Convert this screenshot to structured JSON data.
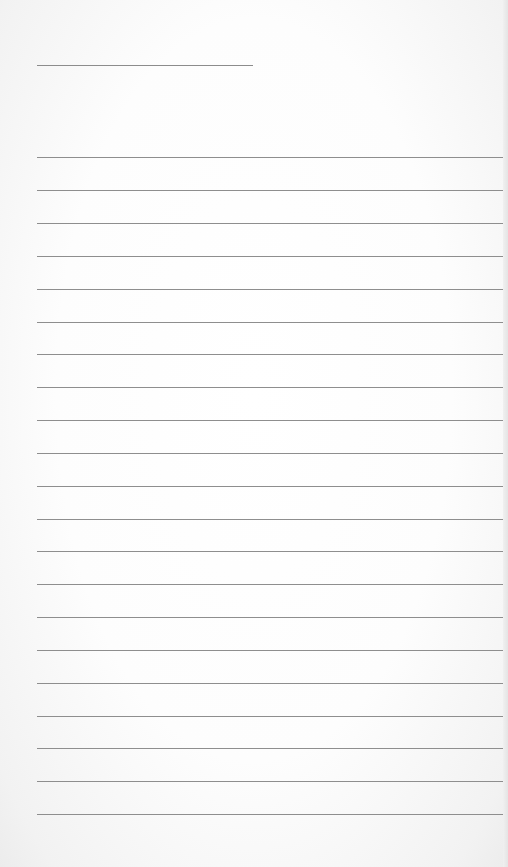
{
  "page": {
    "type": "lined notepad sheet",
    "background_color": "#fdfdfd",
    "line_color": "#8e8e8e"
  },
  "header_line": {
    "x": 37,
    "y": 65,
    "width": 216
  },
  "rules": {
    "count": 21,
    "x": 37,
    "width": 467,
    "y_positions": [
      157,
      190,
      223,
      256,
      289,
      322,
      354,
      387,
      420,
      453,
      486,
      519,
      551,
      584,
      617,
      650,
      683,
      716,
      748,
      781,
      814
    ]
  }
}
